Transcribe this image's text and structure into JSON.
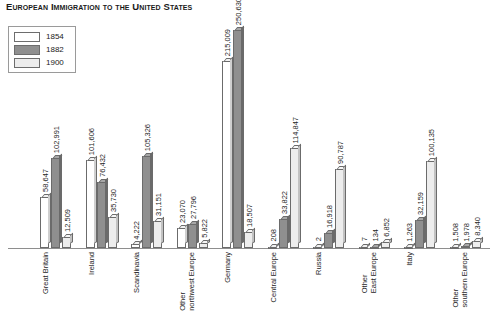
{
  "chart_data": {
    "type": "bar",
    "title": "European Immigration to the United States",
    "xlabel": "",
    "ylabel": "",
    "ylim": [
      0,
      250630
    ],
    "grid": false,
    "legend_position": "top-left",
    "categories": [
      "Great Britain",
      "Ireland",
      "Scandinavia",
      "Other\nnorthwest Europe",
      "Germany",
      "Central Europe",
      "Russia",
      "Other\nEast Europe",
      "Italy",
      "Other\nsouthern Europe"
    ],
    "series": [
      {
        "name": "1854",
        "color": "#ffffff",
        "values": [
          58647,
          101606,
          4222,
          23070,
          215009,
          208,
          2,
          7,
          1263,
          1508
        ],
        "labels": [
          "58,647",
          "101,606",
          "4,222",
          "23,070",
          "215,009",
          "208",
          "2",
          "7",
          "1,263",
          "1,508"
        ]
      },
      {
        "name": "1882",
        "color": "#8f8f8f",
        "values": [
          102991,
          76432,
          105326,
          27796,
          250630,
          33822,
          16918,
          134,
          32159,
          1978
        ],
        "labels": [
          "102,991",
          "76,432",
          "105,326",
          "27,796",
          "250,630",
          "33,822",
          "16,918",
          "134",
          "32,159",
          "1,978"
        ]
      },
      {
        "name": "1900",
        "color": "#ededed",
        "values": [
          12509,
          35730,
          31151,
          5822,
          18507,
          114847,
          90787,
          6852,
          100135,
          8340
        ],
        "labels": [
          "12,509",
          "35,730",
          "31,151",
          "5,822",
          "18,507",
          "114,847",
          "90,787",
          "6,852",
          "100,135",
          "8,340"
        ]
      }
    ]
  },
  "legend": {
    "items": [
      {
        "label": "1854"
      },
      {
        "label": "1882"
      },
      {
        "label": "1900"
      }
    ]
  }
}
